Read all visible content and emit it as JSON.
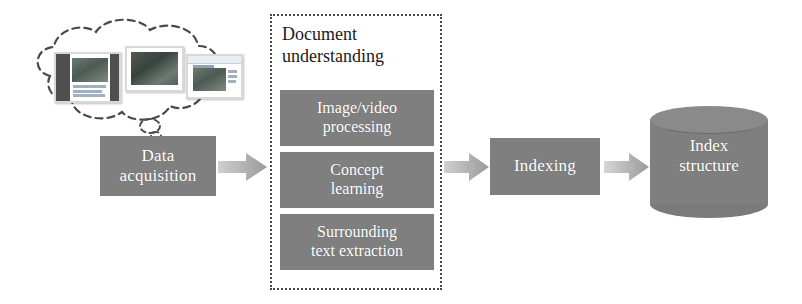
{
  "diagram": {
    "background_color": "#ffffff",
    "box_fill_color": "#7f7f7f",
    "box_text_color": "#ffffff",
    "arrow_color": "#b0b0b0",
    "dotted_border_color": "#4a4a4a"
  },
  "stages": {
    "data_acquisition": {
      "line1": "Data",
      "line2": "acquisition"
    },
    "document_understanding": {
      "title_line1": "Document",
      "title_line2": "understanding",
      "boxes": [
        {
          "line1": "Image/video",
          "line2": "processing"
        },
        {
          "line1": "Concept",
          "line2": "learning"
        },
        {
          "line1": "Surrounding",
          "line2": "text extraction"
        }
      ]
    },
    "indexing": {
      "label": "Indexing"
    },
    "index_structure": {
      "line1": "Index",
      "line2": "structure"
    }
  },
  "icons": {
    "cloud": "cloud-icon",
    "thumbnail_1": "document-thumbnail-icon",
    "thumbnail_2": "photo-thumbnail-icon",
    "thumbnail_3": "webpage-thumbnail-icon",
    "arrow_1": "right-block-arrow-icon",
    "arrow_2": "right-block-arrow-icon",
    "arrow_3": "right-block-arrow-icon",
    "cylinder": "database-cylinder-icon"
  }
}
